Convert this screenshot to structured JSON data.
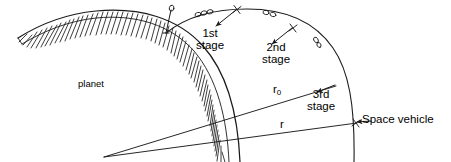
{
  "figure": {
    "background_color": "#ffffff",
    "ink_color": "#1a1a1a",
    "width": 451,
    "height": 162
  },
  "labels": {
    "planet": "planet",
    "stage1_line1": "1st",
    "stage1_line2": "stage",
    "stage2_line1": "2nd",
    "stage2_line2": "stage",
    "stage3_line1": "3rd",
    "stage3_line2": "stage",
    "radius_initial": "r",
    "radius_initial_subscript": "0",
    "radius": "r",
    "space_vehicle": "Space vehicle"
  },
  "diagram_elements": {
    "planet_surface": "hatched-arc",
    "trajectory": "ascending-arc",
    "launch_rocket": "vertical-rocket-on-surface",
    "stage_markers": "small-capsule-ovals",
    "separation_marks": "cross-ticks",
    "radius_lines": "two-lines-from-planet-center",
    "arrow_heads": "leader-arrows-to-stages"
  }
}
